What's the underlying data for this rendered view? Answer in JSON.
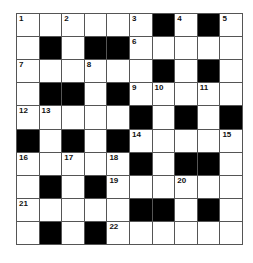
{
  "puzzle": {
    "rows": 10,
    "cols": 10,
    "colors": {
      "block": "#000000",
      "cell": "#ffffff",
      "line": "#555555"
    },
    "grid": [
      [
        "1",
        ".",
        "2",
        ".",
        ".",
        "3",
        "#",
        "4",
        "#",
        "5"
      ],
      [
        ".",
        "#",
        ".",
        "#",
        "#",
        "6",
        ".",
        ".",
        ".",
        "."
      ],
      [
        "7",
        ".",
        ".",
        "8",
        ".",
        ".",
        "#",
        ".",
        "#",
        "."
      ],
      [
        ".",
        "#",
        "#",
        ".",
        "#",
        "9",
        "10",
        ".",
        "11",
        "."
      ],
      [
        "12",
        "13",
        ".",
        ".",
        ".",
        "#",
        ".",
        "#",
        ".",
        "#"
      ],
      [
        "#",
        ".",
        "#",
        ".",
        "#",
        "14",
        ".",
        ".",
        ".",
        "15"
      ],
      [
        "16",
        ".",
        "17",
        ".",
        "18",
        "#",
        ".",
        "#",
        "#",
        "."
      ],
      [
        ".",
        "#",
        ".",
        "#",
        "19",
        ".",
        ".",
        "20",
        ".",
        "."
      ],
      [
        "21",
        ".",
        ".",
        ".",
        ".",
        "#",
        "#",
        ".",
        "#",
        "."
      ],
      [
        ".",
        "#",
        ".",
        "#",
        "22",
        ".",
        ".",
        ".",
        ".",
        "."
      ]
    ]
  }
}
